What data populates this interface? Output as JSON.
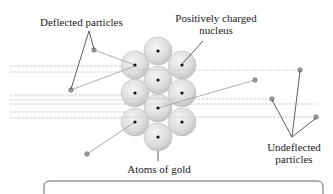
{
  "labels": {
    "deflected": "Deflected particles",
    "nucleus_line1": "Positively charged",
    "nucleus_line2": "nucleus",
    "undeflected_line1": "Undeflected",
    "undeflected_line2": "particles",
    "atoms": "Atoms of gold"
  },
  "colors": {
    "atom_fill": "#dcdcdc",
    "atom_edge": "#bdbdbd",
    "nucleus": "#111111",
    "beam": "#c8c8c8",
    "particle": "#8a8a8a",
    "leader": "#333333",
    "box_border": "#555555"
  },
  "atoms": [
    {
      "cx": 158,
      "cy": 51
    },
    {
      "cx": 135,
      "cy": 65
    },
    {
      "cx": 182,
      "cy": 65
    },
    {
      "cx": 158,
      "cy": 80
    },
    {
      "cx": 135,
      "cy": 93
    },
    {
      "cx": 182,
      "cy": 93
    },
    {
      "cx": 158,
      "cy": 108
    },
    {
      "cx": 135,
      "cy": 122
    },
    {
      "cx": 182,
      "cy": 122
    },
    {
      "cx": 158,
      "cy": 137
    }
  ],
  "beams_y": [
    66,
    72,
    95,
    100,
    104,
    112,
    118
  ],
  "deflected_particles": [
    {
      "from": [
        135,
        65
      ],
      "to": [
        94,
        50
      ]
    },
    {
      "from": [
        135,
        66
      ],
      "to": [
        71,
        90
      ]
    },
    {
      "from": [
        158,
        108
      ],
      "to": [
        255,
        80
      ]
    },
    {
      "from": [
        135,
        122
      ],
      "to": [
        87,
        154
      ]
    }
  ],
  "undeflected_particles": [
    {
      "y": 70,
      "x_end": 300
    },
    {
      "y": 99,
      "x_end": 272
    },
    {
      "y": 117,
      "x_end": 316
    }
  ]
}
